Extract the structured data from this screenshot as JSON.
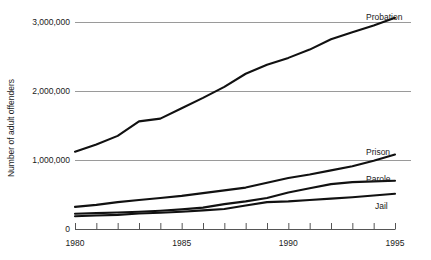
{
  "chart_data": {
    "type": "line",
    "title": "",
    "xlabel": "",
    "ylabel": "Number of adult offenders",
    "xlim": [
      1980,
      1995
    ],
    "ylim": [
      0,
      3200000
    ],
    "grid": true,
    "gridlines_at": [
      1000000,
      2000000,
      3000000
    ],
    "legend_position": "right-inline-labels",
    "x": [
      1980,
      1981,
      1982,
      1983,
      1984,
      1985,
      1986,
      1987,
      1988,
      1989,
      1990,
      1991,
      1992,
      1993,
      1994,
      1995
    ],
    "xtick_labels": [
      "1980",
      "",
      "",
      "",
      "",
      "1985",
      "",
      "",
      "",
      "",
      "1990",
      "",
      "",
      "",
      "",
      "1995"
    ],
    "ytick_labels": [
      "0",
      "1,000,000",
      "2,000,000",
      "3,000,000"
    ],
    "ytick_values": [
      0,
      1000000,
      2000000,
      3000000
    ],
    "series": [
      {
        "name": "Probation",
        "label": "Probation",
        "color": "#111111",
        "values": [
          1120000,
          1225000,
          1350000,
          1560000,
          1600000,
          1750000,
          1900000,
          2060000,
          2250000,
          2380000,
          2480000,
          2600000,
          2750000,
          2850000,
          2950000,
          3060000
        ]
      },
      {
        "name": "Prison",
        "label": "Prison",
        "color": "#111111",
        "values": [
          320000,
          350000,
          390000,
          420000,
          450000,
          480000,
          520000,
          560000,
          600000,
          670000,
          740000,
          790000,
          850000,
          910000,
          990000,
          1080000
        ]
      },
      {
        "name": "Parole",
        "label": "Parole",
        "color": "#111111",
        "values": [
          220000,
          230000,
          240000,
          250000,
          265000,
          285000,
          310000,
          360000,
          400000,
          450000,
          530000,
          590000,
          650000,
          680000,
          690000,
          700000
        ]
      },
      {
        "name": "Jail",
        "label": "Jail",
        "color": "#111111",
        "values": [
          185000,
          195000,
          205000,
          225000,
          235000,
          250000,
          270000,
          290000,
          340000,
          390000,
          400000,
          420000,
          440000,
          460000,
          485000,
          510000
        ]
      }
    ]
  },
  "axes": {
    "y_title": "Number of adult offenders",
    "y_ticks": [
      {
        "label": "3,000,000",
        "value": 3000000
      },
      {
        "label": "2,000,000",
        "value": 2000000
      },
      {
        "label": "1,000,000",
        "value": 1000000
      },
      {
        "label": "0",
        "value": 0
      }
    ],
    "x_ticks": [
      {
        "label": "1980",
        "value": 1980
      },
      {
        "label": "1985",
        "value": 1985
      },
      {
        "label": "1990",
        "value": 1990
      },
      {
        "label": "1995",
        "value": 1995
      }
    ]
  },
  "series_labels": {
    "probation": "Probation",
    "prison": "Prison",
    "parole": "Parole",
    "jail": "Jail"
  },
  "colors": {
    "line": "#111111",
    "gridline": "#9a9a9a",
    "axis": "#555555",
    "background": "#ffffff",
    "text": "#1a1a1a"
  }
}
